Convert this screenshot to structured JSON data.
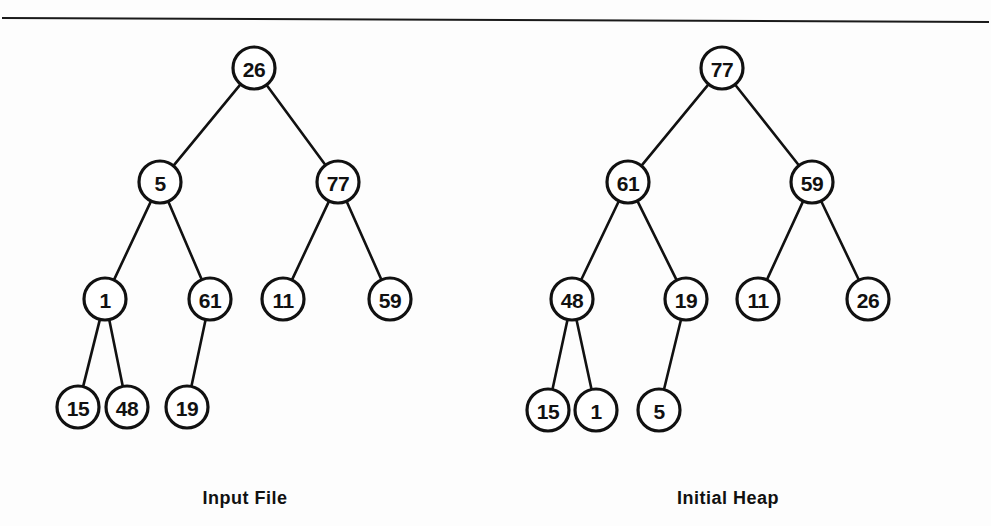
{
  "figure": {
    "background_color": "#fdfdfd",
    "ink_color": "#111111",
    "top_rule": {
      "x1": 2,
      "y1": 18,
      "x2": 989,
      "y2": 22
    }
  },
  "chart_data": {
    "type": "diagram",
    "diagram_kind": "binary-tree-pair",
    "title": "",
    "panels": [
      {
        "id": "input-file",
        "caption": "Input File",
        "caption_x": 245,
        "caption_y": 498,
        "node_radius": 21,
        "nodes": [
          {
            "id": "L0",
            "label": "26",
            "x": 254,
            "y": 68,
            "level": 1,
            "parent": null
          },
          {
            "id": "L1",
            "label": "5",
            "x": 160,
            "y": 182,
            "level": 2,
            "parent": "L0"
          },
          {
            "id": "L2",
            "label": "77",
            "x": 338,
            "y": 182,
            "level": 2,
            "parent": "L0"
          },
          {
            "id": "L3",
            "label": "1",
            "x": 105,
            "y": 299,
            "level": 3,
            "parent": "L1"
          },
          {
            "id": "L4",
            "label": "61",
            "x": 210,
            "y": 299,
            "level": 3,
            "parent": "L1"
          },
          {
            "id": "L5",
            "label": "11",
            "x": 283,
            "y": 299,
            "level": 3,
            "parent": "L2"
          },
          {
            "id": "L6",
            "label": "59",
            "x": 390,
            "y": 299,
            "level": 3,
            "parent": "L2"
          },
          {
            "id": "L7",
            "label": "15",
            "x": 78,
            "y": 407,
            "level": 4,
            "parent": "L3"
          },
          {
            "id": "L8",
            "label": "48",
            "x": 127,
            "y": 407,
            "level": 4,
            "parent": "L3"
          },
          {
            "id": "L9",
            "label": "19",
            "x": 187,
            "y": 407,
            "level": 4,
            "parent": "L4"
          }
        ],
        "edges": [
          {
            "from": "L0",
            "to": "L1"
          },
          {
            "from": "L0",
            "to": "L2"
          },
          {
            "from": "L1",
            "to": "L3"
          },
          {
            "from": "L1",
            "to": "L4"
          },
          {
            "from": "L2",
            "to": "L5"
          },
          {
            "from": "L2",
            "to": "L6"
          },
          {
            "from": "L3",
            "to": "L7"
          },
          {
            "from": "L3",
            "to": "L8"
          },
          {
            "from": "L4",
            "to": "L9"
          }
        ],
        "level_order_values": [
          "26",
          "5",
          "77",
          "1",
          "61",
          "11",
          "59",
          "15",
          "48",
          "19"
        ]
      },
      {
        "id": "initial-heap",
        "caption": "Initial  Heap",
        "caption_x": 728,
        "caption_y": 498,
        "node_radius": 21,
        "nodes": [
          {
            "id": "R0",
            "label": "77",
            "x": 722,
            "y": 68,
            "level": 1,
            "parent": null
          },
          {
            "id": "R1",
            "label": "61",
            "x": 628,
            "y": 182,
            "level": 2,
            "parent": "R0"
          },
          {
            "id": "R2",
            "label": "59",
            "x": 812,
            "y": 182,
            "level": 2,
            "parent": "R0"
          },
          {
            "id": "R3",
            "label": "48",
            "x": 572,
            "y": 299,
            "level": 3,
            "parent": "R1"
          },
          {
            "id": "R4",
            "label": "19",
            "x": 686,
            "y": 299,
            "level": 3,
            "parent": "R1"
          },
          {
            "id": "R5",
            "label": "11",
            "x": 758,
            "y": 299,
            "level": 3,
            "parent": "R2"
          },
          {
            "id": "R6",
            "label": "26",
            "x": 868,
            "y": 299,
            "level": 3,
            "parent": "R2"
          },
          {
            "id": "R7",
            "label": "15",
            "x": 548,
            "y": 410,
            "level": 4,
            "parent": "R3"
          },
          {
            "id": "R8",
            "label": "1",
            "x": 596,
            "y": 410,
            "level": 4,
            "parent": "R3"
          },
          {
            "id": "R9",
            "label": "5",
            "x": 659,
            "y": 410,
            "level": 4,
            "parent": "R4"
          }
        ],
        "edges": [
          {
            "from": "R0",
            "to": "R1"
          },
          {
            "from": "R0",
            "to": "R2"
          },
          {
            "from": "R1",
            "to": "R3"
          },
          {
            "from": "R1",
            "to": "R4"
          },
          {
            "from": "R2",
            "to": "R5"
          },
          {
            "from": "R2",
            "to": "R6"
          },
          {
            "from": "R3",
            "to": "R7"
          },
          {
            "from": "R3",
            "to": "R8"
          },
          {
            "from": "R4",
            "to": "R9"
          }
        ],
        "level_order_values": [
          "77",
          "61",
          "59",
          "48",
          "19",
          "11",
          "26",
          "15",
          "1",
          "5"
        ]
      }
    ]
  }
}
